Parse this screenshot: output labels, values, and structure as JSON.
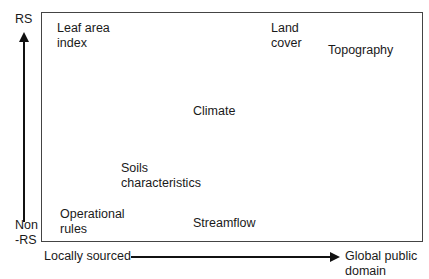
{
  "y_axis": {
    "top_label": "RS",
    "bottom_label": "Non\n-RS"
  },
  "x_axis": {
    "left_label": "Locally sourced",
    "right_label": "Global public\ndomain"
  },
  "items": [
    {
      "label": "Leaf area\nindex"
    },
    {
      "label": "Land\ncover"
    },
    {
      "label": "Topography"
    },
    {
      "label": "Climate"
    },
    {
      "label": "Soils\ncharacteristics"
    },
    {
      "label": "Operational\nrules"
    },
    {
      "label": "Streamflow"
    }
  ]
}
